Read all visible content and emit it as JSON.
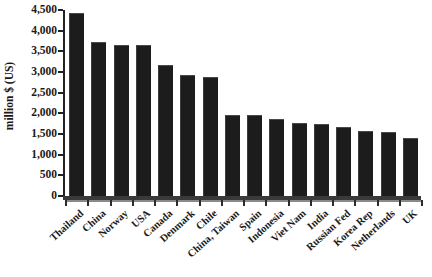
{
  "chart_data": {
    "type": "bar",
    "title": "",
    "xlabel": "",
    "ylabel": "million $ (US)",
    "categories": [
      "Thailand",
      "China",
      "Norway",
      "USA",
      "Canada",
      "Denmark",
      "Chile",
      "China, Taiwan",
      "Spain",
      "Indonesia",
      "Viet Nam",
      "India",
      "Russian Fed",
      "Korea Rep",
      "Netherlands",
      "UK"
    ],
    "values": [
      4400,
      3700,
      3640,
      3620,
      3150,
      2900,
      2850,
      1940,
      1930,
      1840,
      1750,
      1720,
      1650,
      1560,
      1520,
      1390
    ],
    "ylim": [
      0,
      4500
    ],
    "ytick_values": [
      0,
      500,
      1000,
      1500,
      2000,
      2500,
      3000,
      3500,
      4000,
      4500
    ],
    "ytick_labels": [
      "0",
      "500",
      "1,000",
      "1,500",
      "2,000",
      "2,500",
      "3,000",
      "3,500",
      "4,000",
      "4,500"
    ],
    "grid": false,
    "legend": false,
    "bar_color": "#1c1c1c",
    "axis_color": "#222222",
    "background": "#ffffff"
  }
}
